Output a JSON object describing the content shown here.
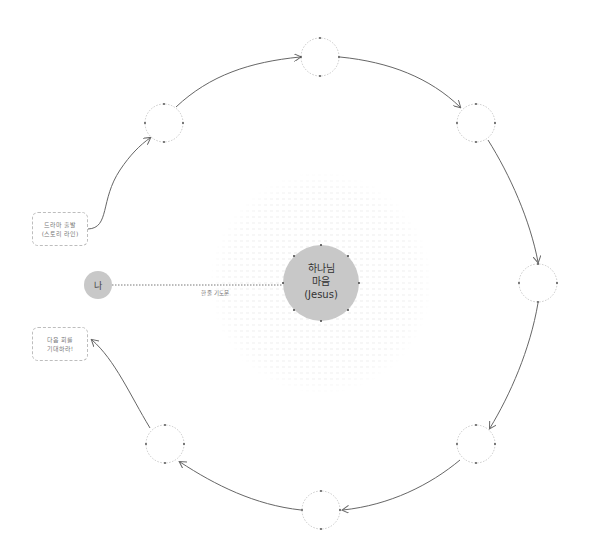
{
  "diagram": {
    "center_node": {
      "line1": "하나님",
      "line2": "마음",
      "line3": "(Jesus)",
      "color": "#c8c8c8"
    },
    "me_node": {
      "label": "나",
      "color": "#c8c8c8"
    },
    "connector_label": "한 줄 기도문",
    "start_box": {
      "line1": "드라마 출발",
      "line2": "(스토리 라인)"
    },
    "end_box": {
      "line1": "다음 회를",
      "line2": "기대하라!"
    },
    "cycle_nodes": [
      {
        "id": "upper-left",
        "label": ""
      },
      {
        "id": "top",
        "label": ""
      },
      {
        "id": "upper-right",
        "label": ""
      },
      {
        "id": "right",
        "label": ""
      },
      {
        "id": "lower-right",
        "label": ""
      },
      {
        "id": "bottom",
        "label": ""
      },
      {
        "id": "lower-left",
        "label": ""
      }
    ],
    "line_color": "#666666",
    "dash_color": "#bdbdbd"
  }
}
